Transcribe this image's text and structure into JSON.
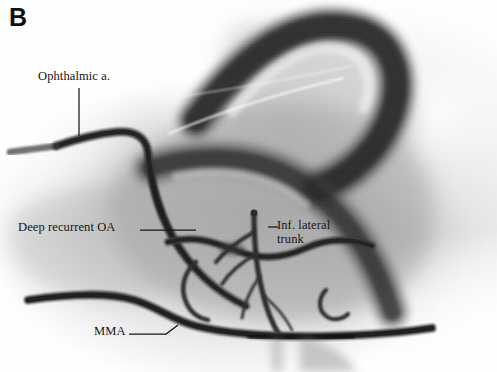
{
  "figure": {
    "panel_letter": "B",
    "modality": "angiographic-illustration",
    "background_color": "#ffffff",
    "tissue_tone": "#9a9a9a",
    "vessel_color": "#262626",
    "label_color": "#141414",
    "width": 497,
    "height": 372
  },
  "annotations": [
    {
      "id": "ophthalmic-artery",
      "text": "Ophthalmic a.",
      "lines": [
        "Ophthalmic a."
      ],
      "label_x": 38,
      "label_y": 70,
      "leader": "vertical-down"
    },
    {
      "id": "deep-recurrent-oa",
      "text": "Deep recurrent OA",
      "lines": [
        "Deep recurrent OA"
      ],
      "label_x": 18,
      "label_y": 221,
      "leader": "horizontal-right"
    },
    {
      "id": "inferior-lateral-trunk",
      "text": "Inf. lateral trunk",
      "lines": [
        "Inf. lateral",
        "trunk"
      ],
      "label_x": 277,
      "label_y": 219,
      "leader": "short-left"
    },
    {
      "id": "middle-meningeal-artery",
      "text": "MMA",
      "lines": [
        "MMA"
      ],
      "label_x": 94,
      "label_y": 325,
      "leader": "angled-right-up"
    }
  ],
  "vessels": [
    {
      "id": "internal-carotid-siphon",
      "label": "internal carotid artery siphon",
      "shade": "#2b2b2b"
    },
    {
      "id": "ophthalmic-artery-course",
      "label": "ophthalmic artery",
      "shade": "#2e2e2e"
    },
    {
      "id": "deep-recurrent-ophthalmic-branch",
      "label": "deep recurrent ophthalmic artery",
      "shade": "#333333"
    },
    {
      "id": "inferolateral-trunk-branches",
      "label": "inferolateral trunk branches",
      "shade": "#303030"
    },
    {
      "id": "middle-meningeal-artery-course",
      "label": "middle meningeal artery",
      "shade": "#2a2a2a"
    }
  ]
}
